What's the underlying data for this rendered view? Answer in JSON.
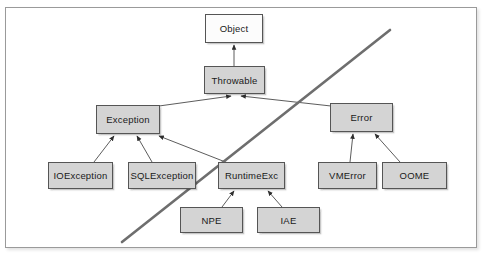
{
  "diagram": {
    "type": "class-hierarchy",
    "frame": {
      "border_color": "#9a9a9a",
      "background": "#ffffff"
    },
    "colors": {
      "node_fill_gray": "#d4d4d4",
      "node_fill_white": "#fcfcfc",
      "node_border": "#555555",
      "edge": "#4a4a4a",
      "divider": "#6e6e6e"
    },
    "nodes": [
      {
        "id": "object",
        "label": "Object",
        "x": 205,
        "y": 14,
        "w": 58,
        "h": 29,
        "fill": "white"
      },
      {
        "id": "throwable",
        "label": "Throwable",
        "x": 204,
        "y": 66,
        "w": 61,
        "h": 28,
        "fill": "gray"
      },
      {
        "id": "exception",
        "label": "Exception",
        "x": 96,
        "y": 105,
        "w": 64,
        "h": 29,
        "fill": "gray"
      },
      {
        "id": "error",
        "label": "Error",
        "x": 330,
        "y": 103,
        "w": 63,
        "h": 29,
        "fill": "gray"
      },
      {
        "id": "ioexception",
        "label": "IOException",
        "x": 48,
        "y": 162,
        "w": 65,
        "h": 27,
        "fill": "gray"
      },
      {
        "id": "sqlexception",
        "label": "SQLException",
        "x": 128,
        "y": 162,
        "w": 68,
        "h": 27,
        "fill": "gray"
      },
      {
        "id": "runtimeexc",
        "label": "RuntimeExc",
        "x": 218,
        "y": 162,
        "w": 67,
        "h": 27,
        "fill": "gray"
      },
      {
        "id": "vmerror",
        "label": "VMError",
        "x": 318,
        "y": 162,
        "w": 59,
        "h": 27,
        "fill": "gray"
      },
      {
        "id": "oome",
        "label": "OOME",
        "x": 382,
        "y": 162,
        "w": 65,
        "h": 27,
        "fill": "gray"
      },
      {
        "id": "npe",
        "label": "NPE",
        "x": 180,
        "y": 207,
        "w": 63,
        "h": 26,
        "fill": "gray"
      },
      {
        "id": "iae",
        "label": "IAE",
        "x": 257,
        "y": 207,
        "w": 63,
        "h": 26,
        "fill": "gray"
      }
    ],
    "edges": [
      {
        "id": "throwable-object",
        "from": "throwable",
        "to": "object",
        "x1": 234,
        "y1": 66,
        "x2": 234,
        "y2": 45
      },
      {
        "id": "exception-throwable",
        "from": "exception",
        "to": "throwable",
        "x1": 159,
        "y1": 106,
        "x2": 231,
        "y2": 96
      },
      {
        "id": "error-throwable",
        "from": "error",
        "to": "throwable",
        "x1": 331,
        "y1": 106,
        "x2": 241,
        "y2": 96
      },
      {
        "id": "ioexception-exception",
        "from": "ioexception",
        "to": "exception",
        "x1": 94,
        "y1": 162,
        "x2": 114,
        "y2": 136
      },
      {
        "id": "sqlexception-exception",
        "from": "sqlexception",
        "to": "exception",
        "x1": 152,
        "y1": 162,
        "x2": 137,
        "y2": 136
      },
      {
        "id": "runtimeexc-exception",
        "from": "runtimeexc",
        "to": "exception",
        "x1": 228,
        "y1": 163,
        "x2": 159,
        "y2": 136
      },
      {
        "id": "vmerror-error",
        "from": "vmerror",
        "to": "error",
        "x1": 350,
        "y1": 162,
        "x2": 353,
        "y2": 134
      },
      {
        "id": "oome-error",
        "from": "oome",
        "to": "error",
        "x1": 400,
        "y1": 162,
        "x2": 375,
        "y2": 134
      },
      {
        "id": "npe-runtimeexc",
        "from": "npe",
        "to": "runtimeexc",
        "x1": 222,
        "y1": 207,
        "x2": 234,
        "y2": 191
      },
      {
        "id": "iae-runtimeexc",
        "from": "iae",
        "to": "runtimeexc",
        "x1": 282,
        "y1": 207,
        "x2": 268,
        "y2": 191
      }
    ],
    "divider": {
      "id": "checked-unchecked-divider",
      "x1": 122,
      "y1": 242,
      "x2": 390,
      "y2": 30,
      "width": 2.6
    }
  }
}
